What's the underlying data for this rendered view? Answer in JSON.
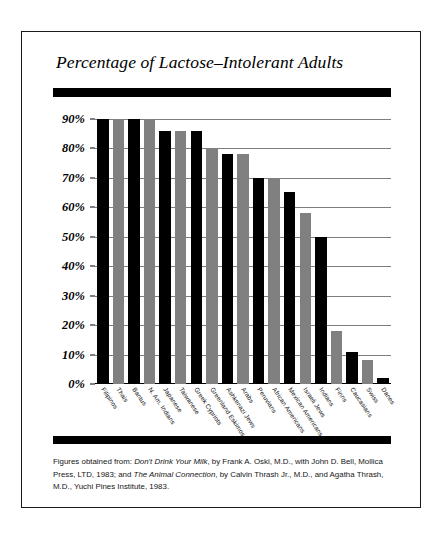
{
  "chart_data": {
    "type": "bar",
    "title": "Percentage of Lactose–Intolerant Adults",
    "xlabel": "",
    "ylabel": "",
    "ylim": [
      0,
      95
    ],
    "grid": true,
    "legend": "none",
    "ytick_labels": [
      "0%",
      "10%",
      "20%",
      "30%",
      "40%",
      "50%",
      "60%",
      "70%",
      "80%",
      "90%"
    ],
    "ytick_values": [
      0,
      10,
      20,
      30,
      40,
      50,
      60,
      70,
      80,
      90
    ],
    "categories": [
      "Filipinos",
      "Thais",
      "Bantus",
      "N. Am. Indians",
      "Japanese",
      "Taiwanese",
      "Greek Cypriots",
      "Greenland Eskimos",
      "Ashkenazi Jews",
      "Arabs",
      "Peruvians",
      "African Americans",
      "Mexican Americans",
      "Israeli Jews",
      "Indians",
      "Finns",
      "Caucasians",
      "Swiss",
      "Danes"
    ],
    "values": [
      90,
      90,
      90,
      90,
      86,
      86,
      86,
      80,
      78,
      78,
      70,
      70,
      65,
      58,
      50,
      18,
      11,
      8,
      2
    ],
    "bar_colors": [
      "#000000",
      "#808080",
      "#000000",
      "#808080",
      "#000000",
      "#808080",
      "#000000",
      "#808080",
      "#000000",
      "#808080",
      "#000000",
      "#808080",
      "#000000",
      "#808080",
      "#000000",
      "#808080",
      "#000000",
      "#808080",
      "#000000"
    ]
  },
  "colors": {
    "bar_black": "#000000",
    "bar_gray": "#808080",
    "gridline": "#7d7d7d",
    "frame": "#1a1a1a",
    "background": "#ffffff"
  },
  "footnote": {
    "part1": "Figures obtained from: ",
    "source1": "Don't Drink Your Milk",
    "part2": ", by Frank A. Oski, M.D., with John D. Bell, Mollica Press, LTD, 1983; and ",
    "source2": "The Animal Connection",
    "part3": ", by Calvin Thrash Jr., M.D., and Agatha Thrash, M.D., Yuchi Pines Institute, 1983."
  }
}
